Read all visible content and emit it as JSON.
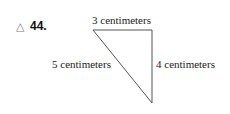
{
  "problem": {
    "marker": "△",
    "number": "44."
  },
  "figure": {
    "type": "right-triangle",
    "top_label": "3 centimeters",
    "hypotenuse_label": "5 centimeters",
    "right_label": "4 centimeters",
    "stroke_color": "#555555"
  }
}
